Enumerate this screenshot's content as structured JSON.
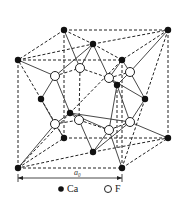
{
  "colors": {
    "line": "#222222",
    "ca": "#111111",
    "f_fill": "#ffffff"
  },
  "dimension": {
    "label": "a₀",
    "sub": "0",
    "x1": 18,
    "x2": 122,
    "y": 178,
    "label_x": 74,
    "label_y": 175
  },
  "legend": {
    "ca": {
      "label": "Ca",
      "icon": "filled-circle",
      "cx": 61,
      "cy": 189,
      "tx": 67,
      "ty": 192
    },
    "f": {
      "label": "F",
      "icon": "open-circle",
      "cx": 108,
      "cy": 189,
      "tx": 115,
      "ty": 192
    }
  },
  "ca_atoms": [
    {
      "id": "c1",
      "x": 64,
      "y": 30
    },
    {
      "id": "c2",
      "x": 168,
      "y": 30
    },
    {
      "id": "c3",
      "x": 18,
      "y": 60
    },
    {
      "id": "c4",
      "x": 122,
      "y": 60
    },
    {
      "id": "c5",
      "x": 93,
      "y": 44
    },
    {
      "id": "c6",
      "x": 117,
      "y": 85
    },
    {
      "id": "c7",
      "x": 41,
      "y": 99
    },
    {
      "id": "c8",
      "x": 145,
      "y": 99
    },
    {
      "id": "c9",
      "x": 70,
      "y": 113
    },
    {
      "id": "c10",
      "x": 64,
      "y": 138
    },
    {
      "id": "c11",
      "x": 168,
      "y": 138
    },
    {
      "id": "c12",
      "x": 93,
      "y": 152
    },
    {
      "id": "c13",
      "x": 18,
      "y": 168
    },
    {
      "id": "c14",
      "x": 122,
      "y": 168
    }
  ],
  "f_atoms": [
    {
      "id": "f1",
      "x": 55,
      "y": 76
    },
    {
      "id": "f2",
      "x": 80,
      "y": 68
    },
    {
      "id": "f3",
      "x": 109,
      "y": 78
    },
    {
      "id": "f4",
      "x": 130,
      "y": 72
    },
    {
      "id": "f5",
      "x": 55,
      "y": 124
    },
    {
      "id": "f6",
      "x": 79,
      "y": 120
    },
    {
      "id": "f7",
      "x": 109,
      "y": 130
    },
    {
      "id": "f8",
      "x": 130,
      "y": 122
    }
  ],
  "dashed_edges": [
    [
      64,
      30,
      168,
      30
    ],
    [
      18,
      60,
      122,
      60
    ],
    [
      64,
      30,
      18,
      60
    ],
    [
      168,
      30,
      122,
      60
    ],
    [
      18,
      60,
      18,
      168
    ],
    [
      122,
      60,
      122,
      168
    ],
    [
      168,
      30,
      168,
      138
    ],
    [
      64,
      30,
      64,
      138
    ],
    [
      18,
      168,
      122,
      168
    ],
    [
      64,
      138,
      168,
      138
    ],
    [
      18,
      168,
      64,
      138
    ],
    [
      122,
      168,
      168,
      138
    ],
    [
      18,
      60,
      93,
      44
    ],
    [
      93,
      44,
      168,
      30
    ],
    [
      64,
      30,
      93,
      44
    ],
    [
      93,
      44,
      122,
      60
    ],
    [
      41,
      99,
      18,
      60
    ],
    [
      41,
      99,
      64,
      138
    ],
    [
      145,
      99,
      168,
      30
    ],
    [
      145,
      99,
      122,
      168
    ],
    [
      70,
      113,
      18,
      168
    ],
    [
      70,
      113,
      122,
      60
    ],
    [
      93,
      152,
      18,
      168
    ],
    [
      93,
      152,
      168,
      138
    ],
    [
      80,
      68,
      109,
      78
    ],
    [
      80,
      68,
      79,
      120
    ],
    [
      79,
      120,
      109,
      130
    ],
    [
      55,
      76,
      80,
      68
    ],
    [
      109,
      78,
      130,
      72
    ],
    [
      55,
      124,
      79,
      120
    ],
    [
      109,
      130,
      130,
      122
    ],
    [
      117,
      85,
      117,
      150
    ]
  ],
  "solid_edges": [
    [
      64,
      30,
      80,
      68
    ],
    [
      93,
      44,
      80,
      68
    ],
    [
      93,
      44,
      109,
      78
    ],
    [
      93,
      44,
      55,
      76
    ],
    [
      18,
      60,
      55,
      76
    ],
    [
      122,
      60,
      130,
      72
    ],
    [
      122,
      60,
      109,
      78
    ],
    [
      168,
      30,
      130,
      72
    ],
    [
      117,
      85,
      109,
      78
    ],
    [
      117,
      85,
      130,
      72
    ],
    [
      55,
      76,
      41,
      99
    ],
    [
      55,
      76,
      70,
      113
    ],
    [
      109,
      78,
      117,
      85
    ],
    [
      130,
      72,
      145,
      99
    ],
    [
      41,
      99,
      55,
      124
    ],
    [
      70,
      113,
      55,
      124
    ],
    [
      70,
      113,
      79,
      120
    ],
    [
      70,
      113,
      130,
      122
    ],
    [
      145,
      99,
      130,
      122
    ],
    [
      145,
      99,
      109,
      78
    ],
    [
      117,
      85,
      109,
      130
    ],
    [
      117,
      85,
      130,
      122
    ],
    [
      55,
      124,
      18,
      168
    ],
    [
      55,
      124,
      64,
      138
    ],
    [
      79,
      120,
      93,
      152
    ],
    [
      109,
      130,
      93,
      152
    ],
    [
      130,
      122,
      168,
      138
    ],
    [
      109,
      130,
      122,
      168
    ],
    [
      130,
      122,
      93,
      152
    ],
    [
      109,
      130,
      70,
      113
    ]
  ]
}
